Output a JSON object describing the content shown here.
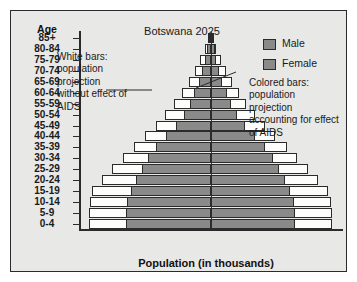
{
  "figure": {
    "title": "Botswana 2025",
    "xlabel": "Population (in thousands)",
    "age_header": "Age"
  },
  "legend": {
    "items": [
      {
        "label": "Male",
        "color": "#8a8a8a"
      },
      {
        "label": "Female",
        "color": "#8a8a8a"
      }
    ]
  },
  "annotations": {
    "left": "White bars: population projection without effect of AIDS",
    "right": "Colored bars: population projection accounting for effect of AIDS"
  },
  "axis": {
    "xticks": [
      "150",
      "100",
      "50",
      "0",
      "50",
      "100",
      "150"
    ],
    "xtick_values": [
      -150,
      -100,
      -50,
      0,
      50,
      100,
      150
    ],
    "xmax": 150
  },
  "chart_data": {
    "type": "bar",
    "subtype": "population-pyramid",
    "title": "Botswana 2025",
    "xlabel": "Population (in thousands)",
    "ylabel": "Age",
    "xlim": [
      -150,
      150
    ],
    "grid": false,
    "legend_position": "top-right",
    "categories": [
      "0-4",
      "5-9",
      "10-14",
      "15-19",
      "20-24",
      "25-29",
      "30-34",
      "35-39",
      "40-44",
      "45-49",
      "50-54",
      "55-59",
      "60-64",
      "65-69",
      "70-74",
      "75-79",
      "80-84",
      "85+"
    ],
    "series": [
      {
        "name": "Male (with AIDS)",
        "side": "left",
        "color": "#8a8a8a",
        "values": [
          97,
          97,
          96,
          91,
          85,
          78,
          72,
          62,
          51,
          40,
          31,
          24,
          19,
          14,
          10,
          7,
          4,
          2
        ]
      },
      {
        "name": "Female (with AIDS)",
        "side": "right",
        "color": "#8a8a8a",
        "values": [
          95,
          95,
          94,
          90,
          84,
          77,
          71,
          61,
          50,
          39,
          30,
          23,
          18,
          13,
          9,
          6,
          4,
          2
        ]
      },
      {
        "name": "Male (without AIDS)",
        "side": "left",
        "color": "#fdfdfb",
        "values": [
          139,
          139,
          137,
          135,
          124,
          112,
          100,
          88,
          75,
          63,
          52,
          42,
          33,
          25,
          18,
          12,
          7,
          3
        ]
      },
      {
        "name": "Female (without AIDS)",
        "side": "right",
        "color": "#fdfdfb",
        "values": [
          137,
          137,
          136,
          133,
          122,
          110,
          98,
          86,
          73,
          61,
          50,
          40,
          32,
          24,
          17,
          11,
          6,
          3
        ]
      }
    ]
  }
}
